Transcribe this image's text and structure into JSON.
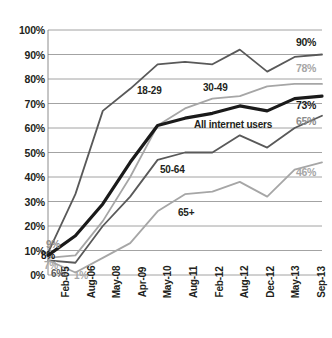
{
  "chart_data": {
    "type": "line",
    "title": "",
    "subtitle": "",
    "xlabel": "",
    "ylabel": "",
    "ylim": [
      0,
      100
    ],
    "ytick_labels": [
      "100%",
      "90%",
      "80%",
      "70%",
      "60%",
      "50%",
      "40%",
      "30%",
      "20%",
      "10%",
      "0%"
    ],
    "ytick_values": [
      100,
      90,
      80,
      70,
      60,
      50,
      40,
      30,
      20,
      10,
      0
    ],
    "grid": "horizontal",
    "legend": "inline-labels",
    "categories": [
      "Feb-05",
      "Aug-06",
      "May-08",
      "Apr-09",
      "May-10",
      "Aug-11",
      "Feb-12",
      "Aug-12",
      "Dec-12",
      "May-13",
      "Sep-13"
    ],
    "series": [
      {
        "name": "18-29",
        "color": "#595959",
        "width": 1.8,
        "values": [
          9,
          33,
          67,
          76,
          86,
          87,
          86,
          92,
          83,
          89,
          90
        ],
        "end_label": "90%",
        "start_label": "9%"
      },
      {
        "name": "30-49",
        "color": "#a6a6a6",
        "width": 1.8,
        "values": [
          7,
          8,
          22,
          40,
          61,
          68,
          72,
          73,
          77,
          78,
          78
        ],
        "end_label": "78%",
        "start_label": "7%"
      },
      {
        "name": "All internet users",
        "color": "#1a1a1a",
        "width": 3.2,
        "values": [
          8,
          16,
          29,
          46,
          61,
          64,
          66,
          69,
          67,
          72,
          73
        ],
        "end_label": "73%",
        "start_label": "8%"
      },
      {
        "name": "50-64",
        "color": "#595959",
        "width": 1.8,
        "values": [
          6,
          5,
          20,
          32,
          47,
          50,
          50,
          57,
          52,
          60,
          65
        ],
        "end_label": "65%",
        "start_label": "6%"
      },
      {
        "name": "65+",
        "color": "#a6a6a6",
        "width": 1.8,
        "values": [
          6,
          1,
          7,
          13,
          26,
          33,
          34,
          38,
          32,
          43,
          46
        ],
        "end_label": "46%",
        "start_label": "1%"
      }
    ],
    "axis_color": "#808080",
    "grid_color": "#8c8c8c",
    "background": "#ffffff"
  },
  "labels": {
    "series_18_29": "18-29",
    "series_30_49": "30-49",
    "series_all": "All internet users",
    "series_50_64": "50-64",
    "series_65plus": "65+",
    "end_90": "90%",
    "end_78": "78%",
    "end_73": "73%",
    "end_65": "65%",
    "end_46": "46%",
    "start_9": "9%",
    "start_8": "8%",
    "start_7": "7%",
    "start_6": "6%",
    "start_1": "1%"
  }
}
